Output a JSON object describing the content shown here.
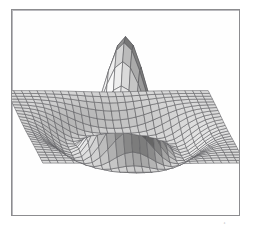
{
  "figure": {
    "title": "",
    "caption": "The 3D surface of the sinc-like sombrero function on a square grid",
    "background_color": "#ffffff",
    "frame_color": "#8c8c8f",
    "mesh_color": "#5a5a5e",
    "surface_fill": "#fdfdfd",
    "shading": "grayscale"
  },
  "chart_data": {
    "type": "surface",
    "title": "",
    "subtitle": "",
    "xlabel": "",
    "ylabel": "",
    "zlabel": "",
    "function": "sombrero / Mexican hat",
    "formula": "z = exp(-r^2/s1) - 0.35*exp(-(r-r0)^2/s2)",
    "grid": true,
    "legend": "none",
    "legend_position": "none",
    "tick_labels_x": [],
    "tick_labels_y": [],
    "tick_labels_z": [],
    "xlim": [
      -3,
      3
    ],
    "ylim": [
      -3,
      3
    ],
    "zlim": [
      -0.35,
      1.0
    ],
    "grid_divisions_u": 26,
    "grid_divisions_v": 26,
    "view_elevation_deg": 24,
    "view_azimuth_deg": 0,
    "features": [
      {
        "name": "central-peak",
        "height": 1.0,
        "radius": 0.0
      },
      {
        "name": "circular-trough",
        "height": -0.3,
        "radius": 1.55
      },
      {
        "name": "outer-brim",
        "height": 0.0,
        "radius": 2.6
      }
    ],
    "series": [
      {
        "name": "mesh-surface",
        "values": [
          1.0,
          0.98,
          0.92,
          0.8,
          0.62,
          0.42,
          0.2,
          0.02,
          -0.14,
          -0.26,
          -0.3,
          -0.28,
          -0.2,
          -0.1,
          -0.03,
          0.0
        ]
      }
    ],
    "radial_profile": {
      "r": [
        0.0,
        0.2,
        0.4,
        0.6,
        0.8,
        1.0,
        1.2,
        1.4,
        1.55,
        1.7,
        1.9,
        2.1,
        2.3,
        2.5,
        2.6
      ],
      "z": [
        1.0,
        0.96,
        0.86,
        0.7,
        0.5,
        0.29,
        0.08,
        -0.14,
        -0.3,
        -0.29,
        -0.21,
        -0.12,
        -0.05,
        -0.01,
        0.0
      ]
    }
  }
}
